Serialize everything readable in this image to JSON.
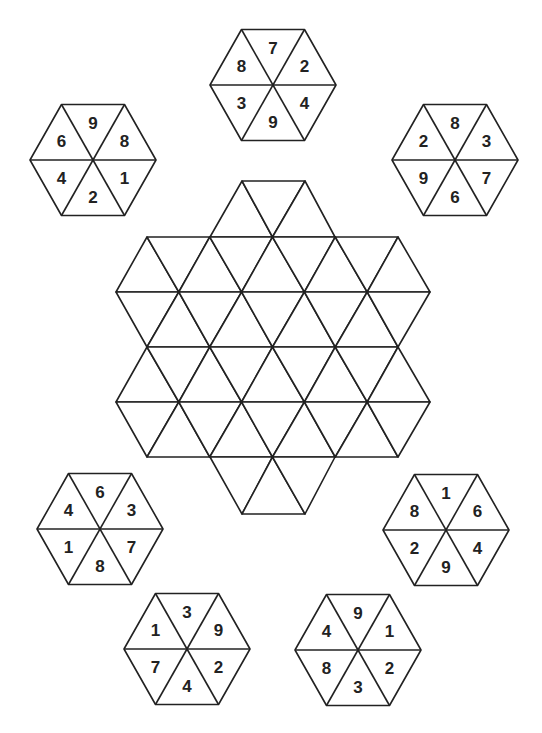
{
  "puzzle": {
    "type": "hexagon-tile-placement",
    "colors": {
      "line": "#222222",
      "background": "#ffffff",
      "text": "#222222"
    },
    "board": {
      "description": "Star-shaped grid of equilateral triangles",
      "triangle_side": 63,
      "row_height": 55,
      "rows_y": [
        181,
        237,
        292,
        347,
        402,
        457,
        514
      ]
    },
    "tiles_order_note": "numbers listed clockwise starting from the top triangle: top, upper-right, lower-right, bottom, lower-left, upper-left",
    "tiles": [
      {
        "id": "tile-top",
        "center": [
          273,
          85
        ],
        "numbers": [
          "7",
          "2",
          "4",
          "9",
          "3",
          "8"
        ]
      },
      {
        "id": "tile-top-left",
        "center": [
          93,
          160
        ],
        "numbers": [
          "9",
          "8",
          "1",
          "2",
          "4",
          "6"
        ]
      },
      {
        "id": "tile-top-right",
        "center": [
          455,
          160
        ],
        "numbers": [
          "8",
          "3",
          "7",
          "6",
          "9",
          "2"
        ]
      },
      {
        "id": "tile-middle-left",
        "center": [
          100,
          529
        ],
        "numbers": [
          "6",
          "3",
          "7",
          "8",
          "1",
          "4"
        ]
      },
      {
        "id": "tile-middle-right",
        "center": [
          446,
          530
        ],
        "numbers": [
          "1",
          "6",
          "4",
          "9",
          "2",
          "8"
        ]
      },
      {
        "id": "tile-bottom-left",
        "center": [
          187,
          649
        ],
        "numbers": [
          "3",
          "9",
          "2",
          "4",
          "7",
          "1"
        ]
      },
      {
        "id": "tile-bottom-right",
        "center": [
          358,
          650
        ],
        "numbers": [
          "9",
          "1",
          "2",
          "3",
          "8",
          "4"
        ]
      }
    ]
  }
}
